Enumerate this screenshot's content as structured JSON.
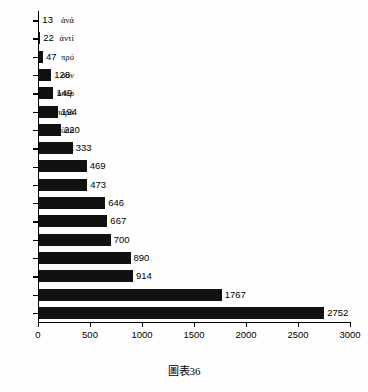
{
  "caption": "圖表36",
  "chart_data": {
    "type": "bar",
    "orientation": "horizontal",
    "title": "",
    "subtitle": "",
    "xlabel": "",
    "ylabel": "",
    "xlim": [
      0,
      3000
    ],
    "xticks": [
      0,
      500,
      1000,
      1500,
      2000,
      2500,
      3000
    ],
    "xtick_labels": [
      "0",
      "500",
      "1000",
      "1500",
      "2000",
      "2500",
      "3000"
    ],
    "grid": false,
    "legend": false,
    "bar_color": "#111111",
    "show_value_labels": true,
    "categories": [
      "ἀνά",
      "ἀντί",
      "πρό",
      "σύν",
      "ὑπέρ",
      "παρά",
      "ὑπό",
      "περί",
      "μετά",
      "κατά",
      "ἀπό",
      "διά",
      "πρός",
      "ἐπί",
      "ἐκ",
      "εἰς",
      "ἐν"
    ],
    "values": [
      13,
      22,
      47,
      128,
      149,
      194,
      220,
      333,
      469,
      473,
      646,
      667,
      700,
      890,
      914,
      1767,
      2752
    ],
    "value_labels": [
      "13",
      "22",
      "47",
      "128",
      "149",
      "194",
      "220",
      "333",
      "469",
      "473",
      "646",
      "667",
      "700",
      "890",
      "914",
      "1767",
      "2752"
    ]
  }
}
